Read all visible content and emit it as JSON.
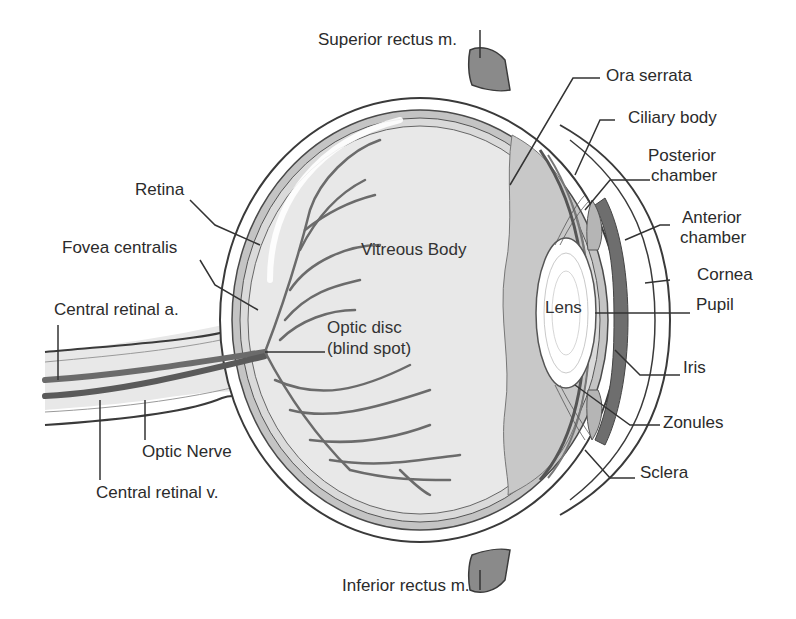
{
  "diagram": {
    "colors": {
      "outline": "#3a3a3a",
      "sclera_fill": "#ffffff",
      "choroid": "#bdbdbd",
      "retina": "#d6d6d6",
      "vitreous": "#e6e6e6",
      "ciliary": "#b0b0b0",
      "iris": "#6e6e6e",
      "lens": "#ffffff",
      "vessels": "#6b6b6b",
      "muscle": "#8a8a8a",
      "leader": "#333333"
    },
    "labels": {
      "superior_rectus": "Superior rectus m.",
      "ora_serrata": "Ora serrata",
      "ciliary_body": "Ciliary body",
      "posterior_chamber_1": "Posterior",
      "posterior_chamber_2": "chamber",
      "anterior_chamber_1": "Anterior",
      "anterior_chamber_2": "chamber",
      "cornea": "Cornea",
      "pupil": "Pupil",
      "iris": "Iris",
      "zonules": "Zonules",
      "sclera": "Sclera",
      "inferior_rectus": "Inferior rectus m.",
      "retina": "Retina",
      "fovea_centralis": "Fovea centralis",
      "central_retinal_artery": "Central retinal a.",
      "optic_nerve": "Optic Nerve",
      "central_retinal_vein": "Central retinal v.",
      "vitreous_body": "Vitreous Body",
      "optic_disc_1": "Optic disc",
      "optic_disc_2": "(blind spot)",
      "lens": "Lens"
    }
  }
}
